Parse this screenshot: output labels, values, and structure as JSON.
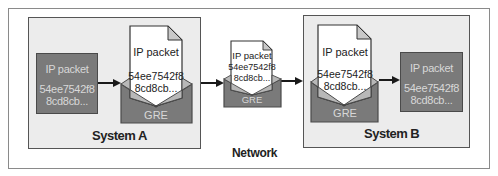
{
  "network": {
    "label": "Network"
  },
  "system_a": {
    "label": "System A",
    "packet": {
      "title": "IP packet",
      "line1": "54ee7542f8",
      "line2": "8cd8cb..."
    },
    "envelope": {
      "label": "GRE",
      "letter_title": "IP packet",
      "letter_line1": "54ee7542f8",
      "letter_line2": "8cd8cb..."
    }
  },
  "in_transit": {
    "envelope": {
      "label": "GRE",
      "letter_title": "IP packet",
      "letter_line1": "54ee7542f8",
      "letter_line2": "8cd8cb..."
    }
  },
  "system_b": {
    "label": "System B",
    "packet": {
      "title": "IP packet",
      "line1": "54ee7542f8",
      "line2": "8cd8cb..."
    },
    "envelope": {
      "label": "GRE",
      "letter_title": "IP packet",
      "letter_line1": "54ee7542f8",
      "letter_line2": "8cd8cb..."
    }
  },
  "colors": {
    "packet_fill": "#7a7a7a",
    "envelope_fill": "#7a7a7a",
    "system_fill": "#ececec",
    "letter_fill": "#ffffff",
    "fold_fill": "#c8c8c8"
  }
}
